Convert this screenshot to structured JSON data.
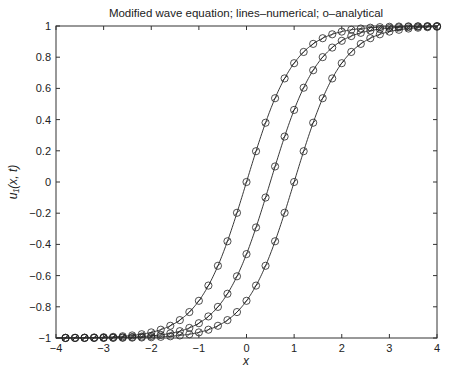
{
  "chart_data": {
    "type": "line",
    "title": "Modified wave equation; lines–numerical; o–analytical",
    "xlabel": "x",
    "ylabel": "u₁(x, t)",
    "xlim": [
      -4,
      4
    ],
    "ylim": [
      -1,
      1
    ],
    "xticks": [
      -4,
      -3,
      -2,
      -1,
      0,
      1,
      2,
      3,
      4
    ],
    "yticks": [
      -1,
      -0.8,
      -0.6,
      -0.4,
      -0.2,
      0,
      0.2,
      0.4,
      0.6,
      0.8,
      1
    ],
    "grid": false,
    "legend": null,
    "marker_x": {
      "start": -3.8,
      "end": 4.0,
      "step": 0.2
    },
    "series": [
      {
        "name": "t1",
        "style": "line + o markers",
        "shape": "tanh",
        "center": 0.0,
        "samples": {
          "x": [
            -4,
            -2,
            -1,
            0,
            1,
            2,
            4
          ],
          "y": [
            -1.0,
            -0.96,
            -0.76,
            0.0,
            0.76,
            0.96,
            1.0
          ]
        }
      },
      {
        "name": "t2",
        "style": "line + o markers",
        "shape": "tanh",
        "center": 0.5,
        "samples": {
          "x": [
            -4,
            -2,
            -1,
            0.5,
            1.5,
            2,
            4
          ],
          "y": [
            -1.0,
            -0.99,
            -0.91,
            0.0,
            0.76,
            0.91,
            1.0
          ]
        }
      },
      {
        "name": "t3",
        "style": "line + o markers",
        "shape": "tanh",
        "center": 1.0,
        "samples": {
          "x": [
            -4,
            -2,
            0,
            1,
            2,
            3,
            4
          ],
          "y": [
            -1.0,
            -0.99,
            -0.76,
            0.0,
            0.76,
            0.96,
            0.99
          ]
        }
      }
    ]
  }
}
